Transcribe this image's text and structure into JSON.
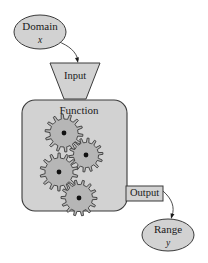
{
  "diagram": {
    "colors": {
      "shape_fill": "#d2d2d2",
      "gear_fill": "#b6b6b6",
      "stroke": "#3a3a3a",
      "text": "#1a1a1a",
      "background": "#ffffff"
    },
    "nodes": {
      "domain": {
        "label": "Domain",
        "variable": "x",
        "shape": "ellipse",
        "cx": 40,
        "cy": 32,
        "rx": 26,
        "ry": 17
      },
      "input": {
        "label": "Input",
        "shape": "inverted-trapezoid",
        "top_left_x": 50,
        "top_right_x": 100,
        "top_y": 63,
        "bottom_left_x": 64,
        "bottom_right_x": 86,
        "bottom_y": 99
      },
      "function": {
        "label": "Function",
        "shape": "rounded-rectangle",
        "x": 22,
        "y": 100,
        "width": 105,
        "height": 111,
        "corner_radius": 13,
        "label_x": 79,
        "label_y": 111
      },
      "output": {
        "label": "Output",
        "shape": "rectangle",
        "x": 126,
        "y": 186,
        "width": 37,
        "height": 15
      },
      "range": {
        "label": "Range",
        "variable": "y",
        "shape": "ellipse",
        "cx": 168,
        "cy": 235,
        "rx": 26,
        "ry": 16
      }
    },
    "gears": [
      {
        "cx": 64,
        "cy": 133,
        "outer_r": 19,
        "inner_r": 14,
        "teeth": 14,
        "hub_r": 2.4,
        "phase": 0
      },
      {
        "cx": 86,
        "cy": 155,
        "outer_r": 17,
        "inner_r": 12.5,
        "teeth": 14,
        "hub_r": 2.4,
        "phase": 13
      },
      {
        "cx": 59,
        "cy": 172,
        "outer_r": 19,
        "inner_r": 14,
        "teeth": 14,
        "hub_r": 2.4,
        "phase": 6
      },
      {
        "cx": 79,
        "cy": 198,
        "outer_r": 18,
        "inner_r": 13.5,
        "teeth": 14,
        "hub_r": 2.4,
        "phase": 20
      }
    ],
    "arrows": [
      {
        "name": "domain-to-input",
        "from": "domain",
        "to": "input",
        "path": "M 57,41 C 70,46 76,52 78,60",
        "head_x": 78,
        "head_y": 63
      },
      {
        "name": "output-to-range",
        "from": "output",
        "to": "range",
        "path": "M 163,191 C 172,199 175,207 172,216",
        "head_x": 171,
        "head_y": 219
      }
    ]
  }
}
